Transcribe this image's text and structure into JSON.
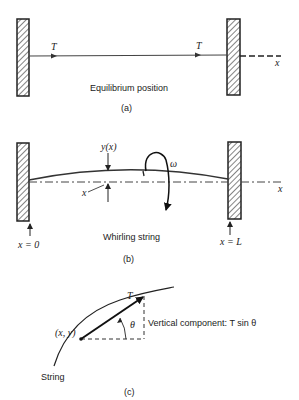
{
  "figure": {
    "panels": [
      {
        "id": "a",
        "caption": "(a)",
        "title": "Equilibrium position",
        "labels": {
          "tension_left": "T",
          "tension_right": "T",
          "axis": "x"
        }
      },
      {
        "id": "b",
        "caption": "(b)",
        "title": "Whirling string",
        "labels": {
          "deflection": "y(x)",
          "position": "x",
          "angular_velocity": "ω",
          "axis": "x",
          "left_end": "x = 0",
          "right_end": "x = L"
        }
      },
      {
        "id": "c",
        "caption": "(c)",
        "labels": {
          "tension": "T",
          "point": "(x, y)",
          "angle": "θ",
          "vertical_component": "Vertical component:  T sin θ",
          "string": "String"
        }
      }
    ]
  }
}
